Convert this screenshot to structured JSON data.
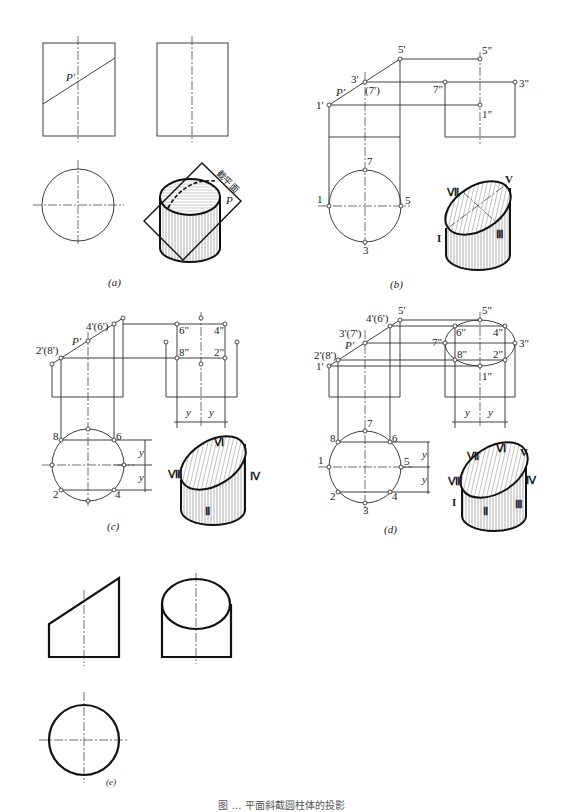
{
  "figure": {
    "caption": "图 … 平面斜截圆柱体的投影",
    "panels": {
      "a": {
        "label": "(a)",
        "plane_label": "P'",
        "iso_plane_text": "截平面",
        "iso_plane_p": "P"
      },
      "b": {
        "label": "(b)",
        "front_labels": {
          "p1": "1'",
          "p3": "3'",
          "p7": "(7')",
          "p5": "5'",
          "plane": "P'"
        },
        "side_labels": {
          "p5": "5\"",
          "p7": "7\"",
          "p3": "3\"",
          "p1": "1\""
        },
        "top_labels": {
          "p7": "7",
          "p1": "1",
          "p5": "5",
          "p3": "3"
        },
        "iso_labels": {
          "I": "I",
          "III": "Ⅲ",
          "V": "V",
          "VII": "Ⅶ"
        }
      },
      "c": {
        "label": "(c)",
        "front_labels": {
          "p2": "2'(8')",
          "p4": "4'(6')",
          "plane": "P'"
        },
        "side_labels": {
          "p6": "6\"",
          "p4": "4\"",
          "p8": "8\"",
          "p2": "2\""
        },
        "top_labels": {
          "p8": "8",
          "p6": "6",
          "p2": "2",
          "p4": "4"
        },
        "dim": "y",
        "iso_labels": {
          "II": "Ⅱ",
          "IV": "Ⅳ",
          "VI": "Ⅵ",
          "VIII": "Ⅷ"
        }
      },
      "d": {
        "label": "(d)",
        "front_labels": {
          "p1": "1'",
          "p2": "2'(8')",
          "p3": "3'(7')",
          "p4": "4'(6')",
          "p5": "5'",
          "plane": "P'"
        },
        "side_labels": {
          "p5": "5\"",
          "p6": "6\"",
          "p4": "4\"",
          "p7": "7\"",
          "p3": "3\"",
          "p8": "8\"",
          "p2": "2\"",
          "p1": "1\""
        },
        "top_labels": {
          "p7": "7",
          "p8": "8",
          "p6": "6",
          "p1": "1",
          "p5": "5",
          "p2": "2",
          "p4": "4",
          "p3": "3"
        },
        "dim": "y",
        "iso_labels": {
          "I": "I",
          "II": "Ⅱ",
          "III": "Ⅲ",
          "IV": "Ⅳ",
          "V": "V",
          "VI": "Ⅵ",
          "VII": "Ⅶ",
          "VIII": "Ⅷ"
        }
      },
      "e": {
        "label": "(e)"
      }
    }
  }
}
